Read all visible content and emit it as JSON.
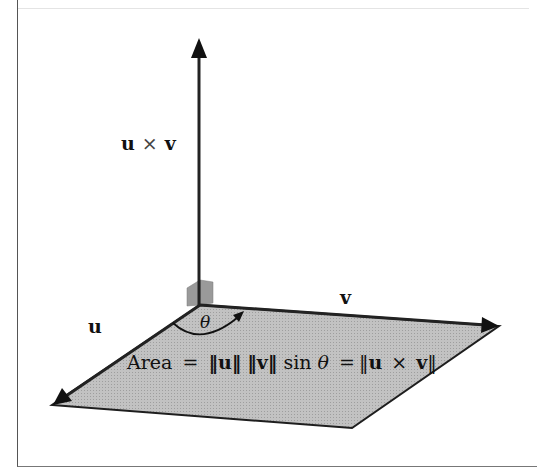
{
  "diagram": {
    "labels": {
      "cross_product": {
        "u": "u",
        "times": "×",
        "v": "v"
      },
      "u_vector": "u",
      "v_vector": "v",
      "theta": "θ",
      "area_formula": {
        "area_word": "Area",
        "eq1": "=",
        "norm_u": "‖u‖",
        "norm_v": "‖v‖",
        "sin": "sin",
        "theta": "θ",
        "eq2": "=",
        "norm_open": "‖",
        "u": "u",
        "times": "×",
        "v": "v",
        "norm_close": "‖"
      }
    },
    "colors": {
      "parallelogram_fill": "#b8b8b8",
      "edge": "#222222",
      "right_angle_box": "#9a9a9a",
      "frame": "#555555"
    },
    "geometry": {
      "origin": [
        200,
        305
      ],
      "u_tip": [
        52,
        405
      ],
      "v_tip": [
        499,
        326
      ],
      "far_corner": [
        352,
        428
      ],
      "cross_tip": [
        199,
        40
      ]
    }
  }
}
